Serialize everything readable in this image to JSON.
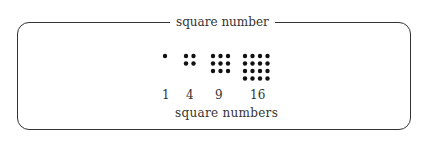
{
  "title": "square number",
  "caption": "square numbers",
  "figures": [
    {
      "value": "1",
      "n": 1
    },
    {
      "value": "4",
      "n": 2
    },
    {
      "value": "9",
      "n": 3
    },
    {
      "value": "16",
      "n": 4
    }
  ]
}
